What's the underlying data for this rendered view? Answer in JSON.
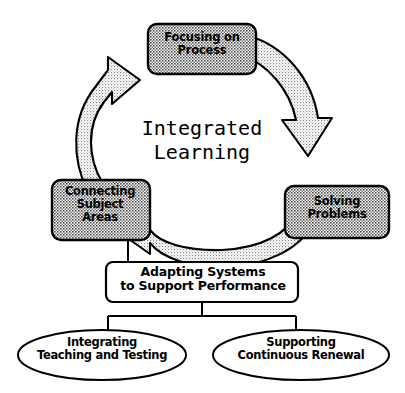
{
  "diagram": {
    "title": "Integrated Learning",
    "center_text_line1": "Integrated",
    "center_text_line2": "Learning",
    "colors": {
      "stroke": "#000000",
      "node_fill_pattern": "#cfcfcf",
      "arrow_fill_pattern": "#e2e2e2",
      "background": "#ffffff",
      "plain_fill": "#ffffff"
    },
    "cycle_nodes": [
      {
        "id": "focusing-on-process",
        "label": "Focusing on\nProcess",
        "line1": "Focusing on",
        "line2": "Process",
        "position": "top",
        "shape": "rounded-rect",
        "fill": "shaded"
      },
      {
        "id": "solving-problems",
        "label": "Solving\nProblems",
        "line1": "Solving",
        "line2": "Problems",
        "position": "right",
        "shape": "rounded-rect",
        "fill": "shaded"
      },
      {
        "id": "connecting-subject-areas",
        "label": "Connecting\nSubject\nAreas",
        "line1": "Connecting",
        "line2": "Subject",
        "line3": "Areas",
        "position": "left",
        "shape": "rounded-rect",
        "fill": "shaded"
      }
    ],
    "cycle_arrows": [
      {
        "id": "arrow-left-up",
        "from": "connecting-subject-areas",
        "to": "focusing-on-process",
        "direction": "counterclockwise-up"
      },
      {
        "id": "arrow-right-down",
        "from": "focusing-on-process",
        "to": "solving-problems",
        "direction": "clockwise-down"
      },
      {
        "id": "arrow-bottom-left",
        "from": "solving-problems",
        "to": "connecting-subject-areas",
        "direction": "right-to-left"
      }
    ],
    "support_box": {
      "id": "adapting-systems",
      "line1": "Adapting Systems",
      "line2": "to Support Performance",
      "label": "Adapting Systems to Support Performance",
      "shape": "rounded-rect",
      "fill": "white"
    },
    "outcome_nodes": [
      {
        "id": "integrating-teaching-testing",
        "line1": "Integrating",
        "line2": "Teaching and Testing",
        "label": "Integrating Teaching and Testing",
        "shape": "ellipse",
        "fill": "white"
      },
      {
        "id": "supporting-continuous-renewal",
        "line1": "Supporting",
        "line2": "Continuous Renewal",
        "label": "Supporting Continuous Renewal",
        "shape": "ellipse",
        "fill": "white"
      }
    ],
    "connectors": [
      {
        "id": "connector-left-node-to-support",
        "from": "connecting-subject-areas",
        "to": "adapting-systems"
      },
      {
        "id": "connector-support-to-outcomes",
        "from": "adapting-systems",
        "to": "outcome-ellipses",
        "style": "tee-branch"
      }
    ]
  }
}
